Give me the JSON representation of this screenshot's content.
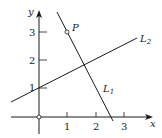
{
  "figure": {
    "axes": {
      "x_label": "x",
      "y_label": "y",
      "x_ticks": [
        "1",
        "2",
        "3"
      ],
      "y_ticks": [
        "1",
        "2",
        "3"
      ]
    },
    "point": {
      "label": "P",
      "coords": [
        1,
        3
      ]
    },
    "lines": [
      {
        "name": "L",
        "sub": "1",
        "description": "line through P(1,3) with negative slope, x-intercept ≈ 2.6"
      },
      {
        "name": "L",
        "sub": "2",
        "description": "line with y-intercept 1 and positive slope ≈ 0.5"
      }
    ],
    "colors": {
      "ink": "#1a1a1a",
      "background": "#ffffff"
    }
  }
}
